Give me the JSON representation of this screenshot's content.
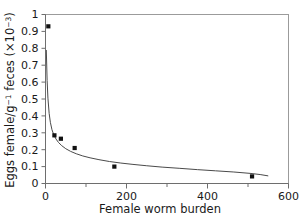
{
  "chart_data": {
    "type": "scatter",
    "title": "",
    "subtitle": "",
    "xlabel": "Female worm burden",
    "ylabel": "Eggs female/g",
    "ylabel_sup1": "−1",
    "ylabel_mid": " feces (×10",
    "ylabel_sup2": "−3",
    "ylabel_end": ")",
    "ylabel_full": "Eggs female/g⁻¹ feces (×10⁻³)",
    "xlim": [
      0,
      600
    ],
    "ylim": [
      0,
      1
    ],
    "grid": false,
    "legend": null,
    "xticks": [
      0,
      100,
      200,
      300,
      400,
      500,
      600
    ],
    "xtick_labels": [
      "0",
      "",
      "200",
      "",
      "400",
      "",
      "600"
    ],
    "yticks": [
      0,
      0.1,
      0.2,
      0.3,
      0.4,
      0.5,
      0.6,
      0.7,
      0.8,
      0.9,
      1
    ],
    "ytick_labels": [
      "0",
      "0.1",
      "0.2",
      "0.3",
      "0.4",
      "0.5",
      "0.6",
      "0.7",
      "0.8",
      "0.9",
      "1"
    ],
    "series": [
      {
        "name": "observed",
        "marker": "square",
        "marker_color": "#111111",
        "points": [
          {
            "x": 7,
            "y": 0.93
          },
          {
            "x": 22,
            "y": 0.285
          },
          {
            "x": 38,
            "y": 0.265
          },
          {
            "x": 72,
            "y": 0.21
          },
          {
            "x": 170,
            "y": 0.1
          },
          {
            "x": 510,
            "y": 0.042
          }
        ]
      },
      {
        "name": "fitted-curve",
        "marker": "none",
        "line_color": "#4a4a4a",
        "points": [
          {
            "x": 2,
            "y": 0.79
          },
          {
            "x": 4,
            "y": 0.61
          },
          {
            "x": 6,
            "y": 0.505
          },
          {
            "x": 9,
            "y": 0.415
          },
          {
            "x": 12,
            "y": 0.362
          },
          {
            "x": 16,
            "y": 0.318
          },
          {
            "x": 20,
            "y": 0.291
          },
          {
            "x": 26,
            "y": 0.263
          },
          {
            "x": 32,
            "y": 0.243
          },
          {
            "x": 40,
            "y": 0.224
          },
          {
            "x": 50,
            "y": 0.206
          },
          {
            "x": 62,
            "y": 0.19
          },
          {
            "x": 76,
            "y": 0.176
          },
          {
            "x": 92,
            "y": 0.163
          },
          {
            "x": 110,
            "y": 0.152
          },
          {
            "x": 132,
            "y": 0.141
          },
          {
            "x": 158,
            "y": 0.13
          },
          {
            "x": 186,
            "y": 0.121
          },
          {
            "x": 216,
            "y": 0.113
          },
          {
            "x": 250,
            "y": 0.105
          },
          {
            "x": 288,
            "y": 0.097
          },
          {
            "x": 330,
            "y": 0.09
          },
          {
            "x": 375,
            "y": 0.082
          },
          {
            "x": 420,
            "y": 0.075
          },
          {
            "x": 465,
            "y": 0.068
          },
          {
            "x": 505,
            "y": 0.06
          },
          {
            "x": 530,
            "y": 0.053
          },
          {
            "x": 550,
            "y": 0.045
          }
        ]
      }
    ]
  }
}
